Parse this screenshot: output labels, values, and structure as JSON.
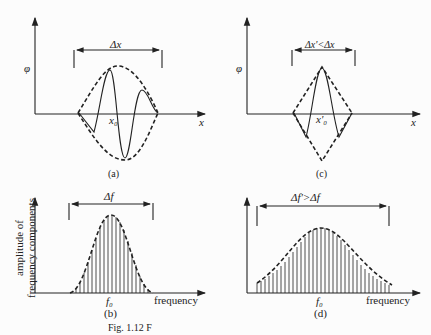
{
  "panels": {
    "a": {
      "label": "(a)",
      "y_axis": "φ",
      "x_axis": "x",
      "width_label": "Δx",
      "center_label": "x₀"
    },
    "c": {
      "label": "(c)",
      "y_axis": "φ",
      "x_axis": "x",
      "width_label": "Δx'<Δx",
      "center_label": "x'₀"
    },
    "b": {
      "label": "(b)",
      "y_axis": "amplitude of\nfrequency components",
      "y_axis_line1": "amplitude of",
      "y_axis_line2": "frequency components",
      "x_axis": "frequency",
      "width_label": "Δf",
      "center_label": "f₀"
    },
    "d": {
      "label": "(d)",
      "x_axis": "frequency",
      "width_label": "Δf'>Δf",
      "center_label": "f₀"
    }
  },
  "caption": "Fig. 1.12  F"
}
